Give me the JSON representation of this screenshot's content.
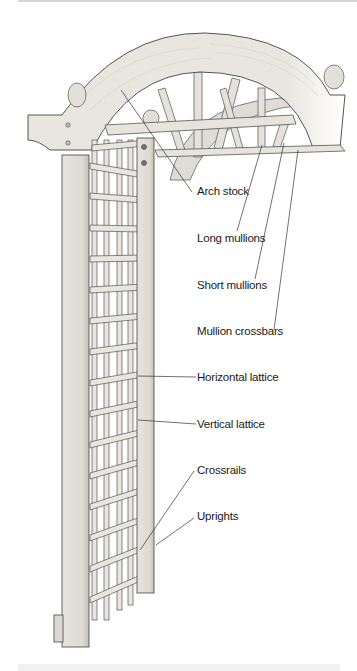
{
  "figure": {
    "colors": {
      "wood_fill": "#e8e6df",
      "wood_shade": "#cfcdc6",
      "outline": "#555555",
      "leader_line": "#333333",
      "text": "#1a1a1a",
      "background": "#ffffff"
    },
    "labels": [
      {
        "id": "arch-stock",
        "text": "Arch stock"
      },
      {
        "id": "long-mullions",
        "text": "Long mullions"
      },
      {
        "id": "short-mullions",
        "text": "Short mullions"
      },
      {
        "id": "mullion-crossbars",
        "text": "Mullion crossbars"
      },
      {
        "id": "horizontal-lattice",
        "text": "Horizontal lattice"
      },
      {
        "id": "vertical-lattice",
        "text": "Vertical lattice"
      },
      {
        "id": "crossrails",
        "text": "Crossrails"
      },
      {
        "id": "uprights",
        "text": "Uprights"
      }
    ]
  }
}
